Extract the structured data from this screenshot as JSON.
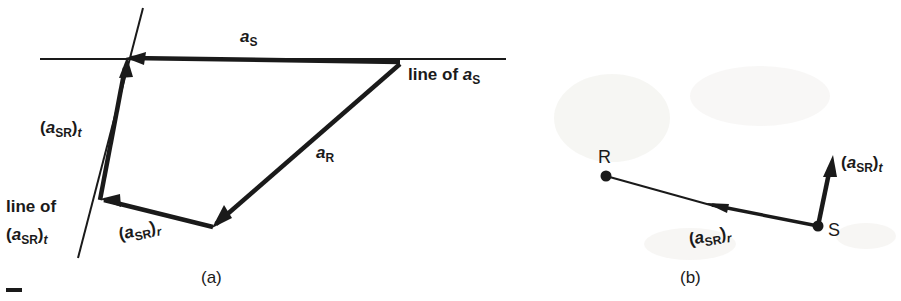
{
  "figure": {
    "background_color": "#ffffff",
    "ink_color": "#1a1a1a",
    "panels": [
      {
        "id": "a",
        "caption": "(a)"
      },
      {
        "id": "b",
        "caption": "(b)"
      }
    ]
  },
  "panel_a": {
    "caption": "(a)",
    "labels": {
      "a_s": {
        "vec": "a",
        "sub": "S"
      },
      "a_r": {
        "vec": "a",
        "sub": "R"
      },
      "line_of_as": {
        "text": "line of ",
        "vec": "a",
        "sub": "S"
      },
      "a_sr_t": {
        "open": "(",
        "vec": "a",
        "sub": "SR",
        "close": ")",
        "sub2": "t"
      },
      "a_sr_r": {
        "open": "(",
        "vec": "a",
        "sub": "SR",
        "close": ")",
        "sub2": "r"
      },
      "line_of_asr_t_line1": "line of",
      "line_of_asr_t_line2": {
        "open": "(",
        "vec": "a",
        "sub": "SR",
        "close": ")",
        "sub2": "t"
      }
    },
    "geometry": {
      "horizontal_line": {
        "x1": 40,
        "y1": 59,
        "x2": 506,
        "y2": 59
      },
      "oblique_line": {
        "x1": 143,
        "y1": 8,
        "x2": 78,
        "y2": 258
      },
      "vertex_top": {
        "x": 400,
        "y": 65
      },
      "vertex_cross": {
        "x": 126,
        "y": 58
      },
      "vertex_bottom": {
        "x": 213,
        "y": 227
      },
      "vertex_left": {
        "x": 100,
        "y": 200
      }
    }
  },
  "panel_b": {
    "caption": "(b)",
    "labels": {
      "point_r": "R",
      "point_s": "S",
      "a_sr_t": {
        "open": "(",
        "vec": "a",
        "sub": "SR",
        "close": ")",
        "sub2": "t"
      },
      "a_sr_r": {
        "open": "(",
        "vec": "a",
        "sub": "SR",
        "close": ")",
        "sub2": "r"
      }
    },
    "geometry": {
      "point_r": {
        "x": 606,
        "y": 176
      },
      "point_s": {
        "x": 818,
        "y": 226
      },
      "arrow_tip": {
        "x": 833,
        "y": 157
      }
    }
  }
}
